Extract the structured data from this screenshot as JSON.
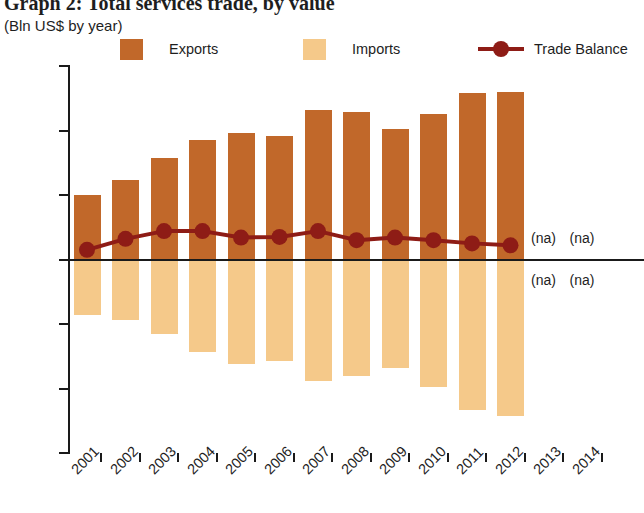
{
  "title": "Graph 2: Total services trade, by value",
  "subtitle": "(Bln US$ by year)",
  "legend": [
    {
      "label": "Exports",
      "type": "swatch",
      "color": "#c1682a"
    },
    {
      "label": "Imports",
      "type": "swatch",
      "color": "#f5c98a"
    },
    {
      "label": "Trade Balance",
      "type": "line-marker",
      "color": "#8e1c16"
    }
  ],
  "na_text": "(na)",
  "na_labels": [
    {
      "text": "(na)",
      "year": "2013",
      "series": "Exports"
    },
    {
      "text": "(na)",
      "year": "2014",
      "series": "Exports"
    },
    {
      "text": "(na)",
      "year": "2013",
      "series": "Imports"
    },
    {
      "text": "(na)",
      "year": "2014",
      "series": "Imports"
    }
  ],
  "chart_data": {
    "type": "bar",
    "title": "Graph 2: Total services trade, by value",
    "subtitle": "(Bln US$ by year)",
    "xlabel": "",
    "ylabel": "Bln US$",
    "ylim": [
      -15,
      15
    ],
    "yticks": [
      15,
      10,
      5,
      0,
      -5,
      -10,
      -15
    ],
    "ytick_labels": [
      "15",
      "10",
      "5",
      "0",
      "-5",
      "-10",
      "-15"
    ],
    "grid": false,
    "legend_position": "top",
    "categories": [
      "2001",
      "2002",
      "2003",
      "2004",
      "2005",
      "2006",
      "2007",
      "2008",
      "2009",
      "2010",
      "2011",
      "2012",
      "2013",
      "2014"
    ],
    "series": [
      {
        "name": "Exports",
        "type": "bar",
        "color": "#c1682a",
        "values": [
          5.0,
          6.2,
          7.9,
          9.3,
          9.8,
          9.6,
          11.6,
          11.4,
          10.1,
          11.3,
          12.9,
          13.0,
          null,
          null
        ]
      },
      {
        "name": "Imports",
        "type": "bar",
        "color": "#f5c98a",
        "values": [
          -4.3,
          -4.7,
          -5.8,
          -7.2,
          -8.1,
          -7.9,
          -9.4,
          -9.0,
          -8.4,
          -9.9,
          -11.7,
          -12.1,
          null,
          null
        ]
      },
      {
        "name": "Trade Balance",
        "type": "line",
        "color": "#8e1c16",
        "values": [
          0.75,
          1.6,
          2.2,
          2.2,
          1.7,
          1.75,
          2.2,
          1.5,
          1.7,
          1.5,
          1.25,
          1.1,
          null,
          null
        ]
      }
    ]
  }
}
